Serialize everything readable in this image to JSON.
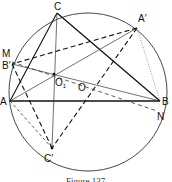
{
  "diagram": {
    "caption": "Figure 137",
    "circle": {
      "cx": 88,
      "cy": 92,
      "r": 79
    },
    "points": {
      "C": {
        "label": "C",
        "x": 57,
        "y": 13
      },
      "A'": {
        "label": "A′",
        "x": 137,
        "y": 28
      },
      "M": {
        "label": "M",
        "x": 11,
        "y": 58
      },
      "B'": {
        "label": "B′",
        "x": 12,
        "y": 64
      },
      "A": {
        "label": "A",
        "x": 10,
        "y": 101
      },
      "B": {
        "label": "B",
        "x": 160,
        "y": 101
      },
      "N": {
        "label": "N",
        "x": 157,
        "y": 111
      },
      "C'": {
        "label": "C′",
        "x": 52,
        "y": 148
      },
      "O1": {
        "label": "O₁",
        "x": 54,
        "y": 74
      },
      "O": {
        "label": "O",
        "x": 80,
        "y": 81
      }
    },
    "labels": {
      "C": "C",
      "A_prime": "A′",
      "M": "M",
      "B_prime": "B′",
      "A": "A",
      "B": "B",
      "N": "N",
      "C_prime": "C′",
      "O1_main": "O",
      "O1_sub": "1",
      "O": "O"
    }
  }
}
